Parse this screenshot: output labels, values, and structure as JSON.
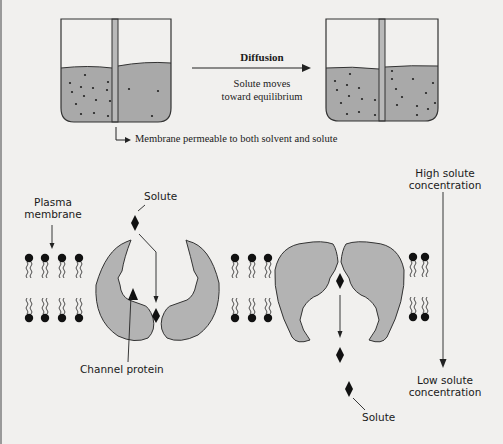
{
  "top_panel": {
    "arrow_title": "Diffusion",
    "arrow_caption_line1": "Solute moves",
    "arrow_caption_line2": "toward equilibrium",
    "membrane_note": "Membrane permeable to both solvent and solute",
    "beaker_left": {
      "label": "initial state",
      "solute_dots_left": 13,
      "solute_dots_right": 3
    },
    "beaker_right": {
      "label": "equilibrium state",
      "solute_dots_left": 9,
      "solute_dots_right": 10
    }
  },
  "bottom_panel": {
    "plasma_membrane_line1": "Plasma",
    "plasma_membrane_line2": "membrane",
    "solute_top": "Solute",
    "channel_protein": "Channel protein",
    "solute_bottom": "Solute",
    "high_line1": "High solute",
    "high_line2": "concentration",
    "low_line1": "Low solute",
    "low_line2": "concentration"
  },
  "colors": {
    "background": "#f1f0ee",
    "fluid": "#a9a9a9",
    "protein": "#b3b3b3",
    "ink": "#1a1a1a"
  }
}
